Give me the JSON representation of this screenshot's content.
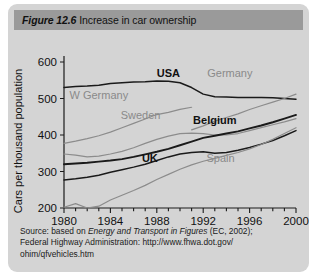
{
  "figure": {
    "number_label": "Figure 12.6",
    "title": "Increase in car ownership"
  },
  "source": {
    "line1_a": "Source: based on ",
    "line1_b": "Energy and Transport in Figures",
    "line1_c": " (EC, 2002);",
    "line2": "Federal Highway Administration: http://www.fhwa.dot.gov/",
    "line3": "ohim/qfvehicles.htm"
  },
  "colors": {
    "card_bg": "#d4d4d4",
    "title_bar": "#9a9a9a",
    "dark_line": "#1a1a1a",
    "light_line": "#8c8c8c",
    "axis": "#1a1a1a",
    "dark_label": "#111111",
    "light_label": "#8a8a8a"
  },
  "chart_data": {
    "type": "line",
    "title": "Increase in car ownership",
    "xlabel": "",
    "ylabel": "Cars per thousand population",
    "xlim": [
      1980,
      2000
    ],
    "ylim": [
      200,
      600
    ],
    "xticks": [
      1980,
      1984,
      1988,
      1992,
      1996,
      2000
    ],
    "xtick_labels": [
      "1980",
      "1984",
      "1988",
      "1992",
      "1996",
      "2000"
    ],
    "minor_xtick_interval": 1,
    "yticks": [
      200,
      300,
      400,
      500,
      600
    ],
    "ytick_labels": [
      "200",
      "300",
      "400",
      "500",
      "600"
    ],
    "grid": false,
    "legend": "inline-labels",
    "x": [
      1980,
      1981,
      1982,
      1983,
      1984,
      1985,
      1986,
      1987,
      1988,
      1989,
      1990,
      1991,
      1992,
      1993,
      1994,
      1995,
      1996,
      1997,
      1998,
      1999,
      2000
    ],
    "series": [
      {
        "name": "USA",
        "style": "dark",
        "label_x": 1989.0,
        "label_y": 560,
        "values": [
          530,
          533,
          534,
          536,
          541,
          543,
          545,
          546,
          548,
          547,
          543,
          530,
          512,
          505,
          504,
          503,
          503,
          503,
          502,
          500,
          498
        ]
      },
      {
        "name": "Germany",
        "style": "light",
        "label_x": 1994.3,
        "label_y": 560,
        "values": [
          null,
          null,
          null,
          null,
          null,
          null,
          null,
          null,
          null,
          null,
          null,
          414,
          425,
          438,
          448,
          458,
          470,
          480,
          490,
          500,
          512
        ]
      },
      {
        "name": "W Germany",
        "style": "light",
        "label_x": 1983.0,
        "label_y": 500,
        "values": [
          377,
          383,
          390,
          398,
          408,
          420,
          432,
          444,
          456,
          462,
          470,
          476,
          null,
          null,
          null,
          null,
          null,
          null,
          null,
          null,
          null
        ]
      },
      {
        "name": "Sweden",
        "style": "light",
        "label_x": 1986.6,
        "label_y": 443,
        "values": [
          348,
          345,
          340,
          342,
          348,
          355,
          365,
          377,
          388,
          397,
          404,
          405,
          404,
          400,
          400,
          404,
          412,
          420,
          428,
          436,
          445
        ]
      },
      {
        "name": "Belgium",
        "style": "dark-bold",
        "label_x": 1993.0,
        "label_y": 430,
        "values": [
          320,
          322,
          324,
          327,
          330,
          334,
          340,
          347,
          354,
          362,
          372,
          382,
          392,
          398,
          404,
          410,
          418,
          426,
          435,
          445,
          455
        ]
      },
      {
        "name": "UK",
        "style": "dark",
        "label_x": 1987.4,
        "label_y": 325,
        "values": [
          277,
          280,
          284,
          290,
          298,
          305,
          312,
          320,
          330,
          340,
          348,
          352,
          354,
          350,
          352,
          358,
          366,
          375,
          385,
          398,
          412
        ]
      },
      {
        "name": "Spain",
        "style": "light",
        "label_x": 1993.5,
        "label_y": 325,
        "values": [
          202,
          212,
          200,
          205,
          222,
          235,
          248,
          262,
          278,
          292,
          306,
          318,
          328,
          336,
          344,
          352,
          362,
          374,
          388,
          404,
          420
        ]
      }
    ]
  }
}
